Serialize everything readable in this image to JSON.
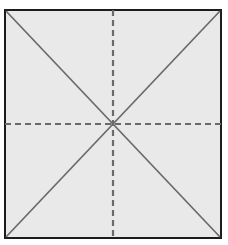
{
  "figure": {
    "name": "square-with-symmetry-axes",
    "caption": "",
    "canvas": {
      "width": 228,
      "height": 245,
      "background": "#ffffff"
    },
    "square": {
      "label": "square-outline",
      "x": 5,
      "y": 10,
      "width": 216,
      "height": 228,
      "fill": "#e9e9e9",
      "stroke": "#1c1c1c",
      "stroke_width": 2.2
    },
    "center_point": {
      "x": 113,
      "y": 124
    },
    "axes": [
      {
        "name": "diagonal-axis-top-left-to-bottom-right",
        "type": "diagonal",
        "style": "solid",
        "x1": 6,
        "y1": 11,
        "x2": 220,
        "y2": 237,
        "color": "#6a6a6a",
        "width": 1.7
      },
      {
        "name": "diagonal-axis-top-right-to-bottom-left",
        "type": "diagonal",
        "style": "solid",
        "x1": 220,
        "y1": 11,
        "x2": 6,
        "y2": 237,
        "color": "#6a6a6a",
        "width": 1.7
      },
      {
        "name": "horizontal-axis",
        "type": "horizontal",
        "style": "dashed",
        "x1": 5,
        "y1": 124,
        "x2": 221,
        "y2": 124,
        "color": "#6a6a6a",
        "width": 2.2,
        "dash": "6 4"
      },
      {
        "name": "vertical-axis",
        "type": "vertical",
        "style": "dashed",
        "x1": 113,
        "y1": 10,
        "x2": 113,
        "y2": 238,
        "color": "#6a6a6a",
        "width": 2.2,
        "dash": "6 4"
      }
    ],
    "axis_count": 4,
    "labels": []
  }
}
